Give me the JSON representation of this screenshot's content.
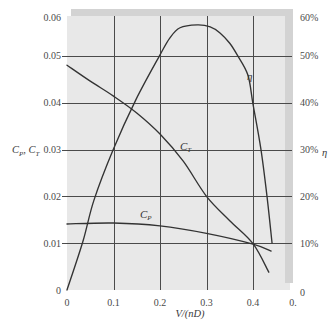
{
  "colors": {
    "plot_bg": "#e8e8e8",
    "frame_shadow": "#d3d3d3",
    "grid": "#4a4a4a",
    "curve": "#333333",
    "text": "#4a4a4a"
  },
  "chart_data": {
    "type": "line",
    "title": "",
    "xlabel": "V/(nD)",
    "ylabel_left": [
      {
        "text": "C",
        "sub": false
      },
      {
        "text": "P",
        "sub": true
      },
      {
        "text": ", C",
        "sub": false
      },
      {
        "text": "T",
        "sub": true
      }
    ],
    "ylabel_right": "η",
    "xlim": [
      0,
      0.5
    ],
    "ylim_left": [
      0,
      0.06
    ],
    "ylim_right": [
      0,
      60
    ],
    "grid": true,
    "legend": null,
    "x_ticks": [
      {
        "value": 0,
        "label": "0"
      },
      {
        "value": 0.1,
        "label": "0.1"
      },
      {
        "value": 0.2,
        "label": "0.2"
      },
      {
        "value": 0.3,
        "label": "0.3"
      },
      {
        "value": 0.4,
        "label": "0.4"
      },
      {
        "value": 0.5,
        "label": "0."
      }
    ],
    "y_left_ticks": [
      {
        "value": 0,
        "label": "0"
      },
      {
        "value": 0.01,
        "label": "0.01"
      },
      {
        "value": 0.02,
        "label": "0.02"
      },
      {
        "value": 0.03,
        "label": "0.03"
      },
      {
        "value": 0.04,
        "label": "0.04"
      },
      {
        "value": 0.05,
        "label": "0.05"
      },
      {
        "value": 0.06,
        "label": "0.06"
      }
    ],
    "y_right_ticks": [
      {
        "value": 0,
        "label": "0"
      },
      {
        "value": 10,
        "label": "10%"
      },
      {
        "value": 20,
        "label": "20%"
      },
      {
        "value": 30,
        "label": "30%"
      },
      {
        "value": 40,
        "label": "40%"
      },
      {
        "value": 50,
        "label": "50%"
      },
      {
        "value": 60,
        "label": "60%"
      }
    ],
    "series": [
      {
        "name": "η",
        "axis": "right",
        "label": {
          "main": "η",
          "sub": ""
        },
        "label_at": [
          0.387,
          44.8
        ],
        "x": [
          0,
          0.034,
          0.058,
          0.099,
          0.148,
          0.2,
          0.221,
          0.243,
          0.28,
          0.308,
          0.329,
          0.35,
          0.366,
          0.389,
          0.4,
          0.417,
          0.43,
          0.441
        ],
        "y": [
          0,
          10.3,
          19.2,
          29.9,
          40.6,
          50.2,
          53.8,
          56.0,
          56.6,
          56.2,
          54.9,
          52.7,
          50.2,
          45.9,
          39.7,
          30.1,
          20.1,
          10.0
        ]
      },
      {
        "name": "C_T",
        "axis": "left",
        "label": {
          "main": "C",
          "sub": "T"
        },
        "label_at": [
          0.243,
          0.0299
        ],
        "x": [
          0,
          0.05,
          0.1,
          0.15,
          0.2,
          0.25,
          0.3,
          0.35,
          0.4,
          0.434
        ],
        "y": [
          0.048,
          0.0446,
          0.0414,
          0.0378,
          0.0333,
          0.0275,
          0.02,
          0.0148,
          0.0099,
          0.0038
        ]
      },
      {
        "name": "C_P",
        "axis": "left",
        "label": {
          "main": "C",
          "sub": "P"
        },
        "label_at": [
          0.157,
          0.0154
        ],
        "x": [
          0,
          0.1,
          0.2,
          0.3,
          0.4,
          0.439
        ],
        "y": [
          0.0141,
          0.0143,
          0.0137,
          0.0121,
          0.0098,
          0.0083
        ]
      }
    ]
  }
}
